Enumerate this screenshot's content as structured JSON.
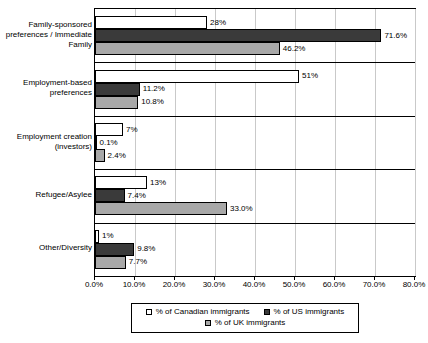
{
  "chart_data": {
    "type": "bar",
    "orientation": "horizontal",
    "title": "",
    "xlabel": "",
    "ylabel": "",
    "xlim": [
      0,
      80
    ],
    "grid": true,
    "legend_position": "bottom",
    "categories": [
      "Family-sponsored preferences / Immediate Family",
      "Employment-based preferences",
      "Employment creation (investors)",
      "Refugee/Asylee",
      "Other/Diversity"
    ],
    "tick_labels": [
      "0.0%",
      "10.0%",
      "20.0%",
      "30.0%",
      "40.0%",
      "50.0%",
      "60.0%",
      "70.0%",
      "80.0%"
    ],
    "tick_values": [
      0,
      10,
      20,
      30,
      40,
      50,
      60,
      70,
      80
    ],
    "series": [
      {
        "name": "% of Canadian immigrants",
        "key": "ca",
        "color": "#ffffff",
        "values": [
          28,
          51,
          7,
          13,
          1
        ],
        "data_labels": [
          "28%",
          "51%",
          "7%",
          "13%",
          "1%"
        ]
      },
      {
        "name": "% of US immigrants",
        "key": "us",
        "color": "#3a3a3a",
        "values": [
          71.6,
          11.2,
          0.1,
          7.4,
          9.8
        ],
        "data_labels": [
          "71.6%",
          "11.2%",
          "0.1%",
          "7.4%",
          "9.8%"
        ]
      },
      {
        "name": "% of UK immigrants",
        "key": "uk",
        "color": "#a8a8a8",
        "values": [
          46.2,
          10.8,
          2.4,
          33.0,
          7.7
        ],
        "data_labels": [
          "46.2%",
          "10.8%",
          "2.4%",
          "33.0%",
          "7.7%"
        ]
      }
    ]
  },
  "legend": {
    "row1": [
      {
        "label": "% of Canadian immigrants",
        "key": "ca"
      },
      {
        "label": "% of US immigrants",
        "key": "us"
      }
    ],
    "row2": [
      {
        "label": "% of UK immigrants",
        "key": "uk"
      }
    ]
  }
}
